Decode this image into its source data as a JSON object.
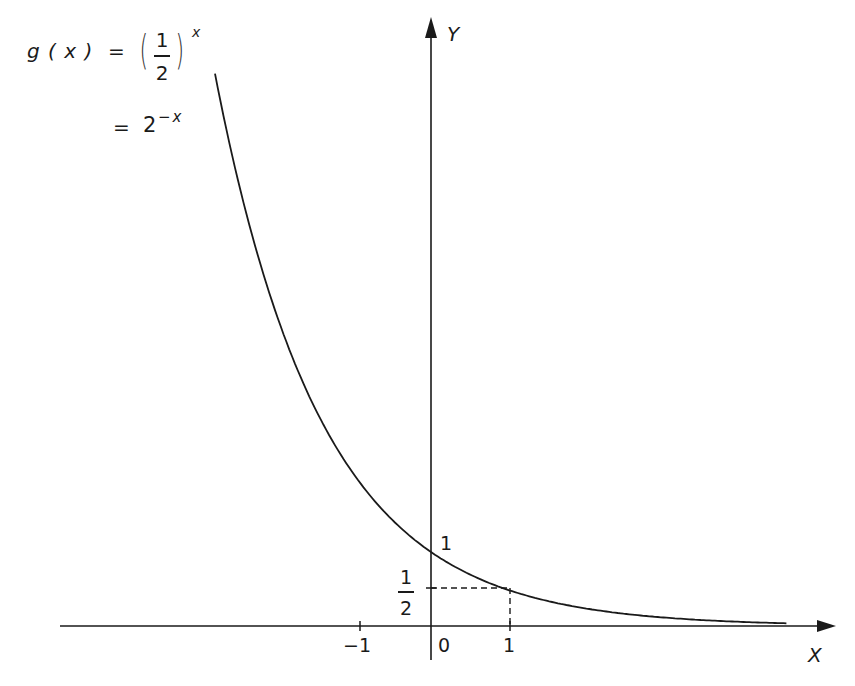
{
  "chart_data": {
    "type": "line",
    "title": "",
    "function": "g(x) = (1/2)^x = 2^(-x)",
    "series": [
      {
        "name": "g(x) = (1/2)^x",
        "x": [
          -2.9,
          -2.5,
          -2,
          -1.5,
          -1,
          -0.5,
          0,
          0.5,
          1,
          1.5,
          2,
          2.5,
          3,
          3.5,
          4,
          4.5,
          4.77
        ],
        "y": [
          7.46,
          5.66,
          4,
          2.83,
          2,
          1.41,
          1,
          0.71,
          0.5,
          0.35,
          0.25,
          0.18,
          0.125,
          0.088,
          0.0625,
          0.044,
          0.037
        ]
      }
    ],
    "annotations": [
      {
        "type": "point",
        "x": 0,
        "y": 1,
        "label": "1"
      },
      {
        "type": "dashed-guide",
        "x": 1,
        "y": 0.5,
        "label_x": "1",
        "label_y": "1/2"
      }
    ],
    "xlabel": "X",
    "ylabel": "Y",
    "x_ticks": [
      -1,
      0,
      1
    ],
    "x_tick_labels": [
      "−1",
      "0",
      "1"
    ],
    "y_tick_labels": [
      "1/2",
      "1"
    ],
    "xlim": [
      -4.9,
      5.4
    ],
    "ylim": [
      -0.46,
      8.1
    ],
    "grid": false,
    "legend": "none"
  },
  "labels": {
    "x_axis": "X",
    "y_axis": "Y",
    "tick_neg1": "−1",
    "tick_0": "0",
    "tick_1": "1",
    "y_one": "1",
    "half_num": "1",
    "half_den": "2"
  },
  "formula": {
    "line1_lhs": "g ( x )  =",
    "line1_num": "1",
    "line1_den": "2",
    "line1_exp": "x",
    "line2_eq": "=",
    "line2_base": "2",
    "line2_exp": "−x"
  },
  "style": {
    "ink": "#1a1a1a",
    "background": "#ffffff"
  }
}
